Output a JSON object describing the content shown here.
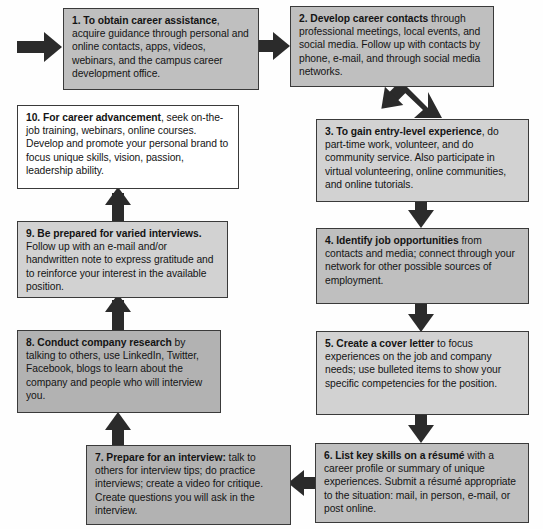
{
  "diagram": {
    "palette": {
      "box_border": "#3a3a3a",
      "arrow": "#2b2b2b",
      "fill_white": "#ffffff",
      "fill_light_gray": "#d2d2d2",
      "fill_medium_gray": "#bfbfbf",
      "fill_dark_gray": "#b2b2b2",
      "text": "#141414",
      "background": "#ffffff"
    },
    "nodes": [
      {
        "id": "step-1",
        "number": "1.",
        "lead": "To obtain career assistance",
        "rest": ", acquire guidance through personal and online contacts, apps, videos, webinars, and the campus career development office.",
        "fill": "medium-gray"
      },
      {
        "id": "step-2",
        "number": "2.",
        "lead": "Develop career contacts",
        "rest": " through professional meetings, local events, and social media. Follow up with contacts by phone, e-mail, and through social media networks.",
        "fill": "medium-gray"
      },
      {
        "id": "step-3",
        "number": "3.",
        "lead": "To gain entry-level experience",
        "rest": ", do part-time work, volunteer, and do community service. Also participate in virtual volunteering, online communities, and online tutorials.",
        "fill": "light-gray"
      },
      {
        "id": "step-4",
        "number": "4.",
        "lead": "Identify job opportunities",
        "rest": " from contacts and media; connect through your network for other possible sources of employment.",
        "fill": "medium-gray"
      },
      {
        "id": "step-5",
        "number": "5.",
        "lead": "Create a cover letter",
        "rest": " to focus experiences on the job and company needs; use bulleted items to show your specific competencies for the position.",
        "fill": "light-gray"
      },
      {
        "id": "step-6",
        "number": "6.",
        "lead": "List key skills on a résumé",
        "rest": " with a career profile or summary of unique experiences. Submit a résumé appropriate to the situation: mail, in person, e-mail, or post online.",
        "fill": "medium-gray"
      },
      {
        "id": "step-7",
        "number": "7.",
        "lead": "Prepare for an interview:",
        "rest": " talk to others for interview tips; do practice interviews; create a video for critique. Create questions you will ask in the interview.",
        "fill": "dark-gray"
      },
      {
        "id": "step-8",
        "number": "8.",
        "lead": "Conduct company research",
        "rest": " by talking to others, use LinkedIn, Twitter, Facebook, blogs to learn about the company and people who will interview you.",
        "fill": "dark-gray"
      },
      {
        "id": "step-9",
        "number": "9.",
        "lead": "Be prepared for varied interviews.",
        "rest": " Follow up with an e-mail and/or handwritten note to express gratitude and to reinforce your interest in the available position.",
        "fill": "light-gray"
      },
      {
        "id": "step-10",
        "number": "10.",
        "lead": "For career advancement",
        "rest": ", seek on-the-job training, webinars, online courses. Develop and promote your personal brand to focus unique skills, vision, passion, leadership ability.",
        "fill": "white"
      }
    ],
    "connectors": [
      {
        "id": "entry-arrow",
        "from": "start",
        "to": "step-1",
        "direction": "right"
      },
      {
        "id": "arrow-1-2",
        "from": "step-1",
        "to": "step-2",
        "direction": "right"
      },
      {
        "id": "arrow-2-3",
        "from": "step-2",
        "to": "step-3",
        "direction": "down-right"
      },
      {
        "id": "arrow-3-4",
        "from": "step-3",
        "to": "step-4",
        "direction": "down"
      },
      {
        "id": "arrow-4-5",
        "from": "step-4",
        "to": "step-5",
        "direction": "down"
      },
      {
        "id": "arrow-5-6",
        "from": "step-5",
        "to": "step-6",
        "direction": "down"
      },
      {
        "id": "arrow-6-7",
        "from": "step-6",
        "to": "step-7",
        "direction": "left"
      },
      {
        "id": "arrow-7-8",
        "from": "step-7",
        "to": "step-8",
        "direction": "up"
      },
      {
        "id": "arrow-8-9",
        "from": "step-8",
        "to": "step-9",
        "direction": "up"
      },
      {
        "id": "arrow-9-10",
        "from": "step-9",
        "to": "step-10",
        "direction": "up"
      }
    ]
  }
}
